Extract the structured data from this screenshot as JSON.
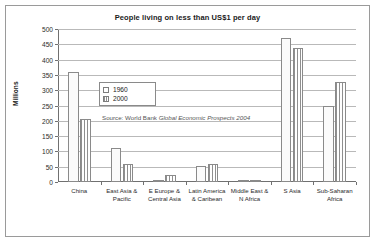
{
  "chart_data": {
    "type": "bar",
    "title": "People living on less than US$1 per day",
    "xlabel": "",
    "ylabel": "Millions",
    "ylim": [
      0,
      500
    ],
    "yticks": [
      0,
      50,
      100,
      150,
      200,
      250,
      300,
      350,
      400,
      450,
      500
    ],
    "grid": true,
    "legend_position": "inside-upper-left",
    "categories": [
      "China",
      "East Asia &\nPacific",
      "E Europe &\nCentral Asia",
      "Latin America\n& Caribean",
      "Middle East &\nN Africa",
      "S Asia",
      "Sub-Saharan\nAfrica"
    ],
    "series": [
      {
        "name": "1960",
        "values": [
          360,
          110,
          7,
          52,
          5,
          470,
          247
        ]
      },
      {
        "name": "2000",
        "values": [
          205,
          58,
          22,
          58,
          8,
          437,
          328
        ]
      }
    ],
    "annotations": {
      "source_prefix": "Source:  World Bank ",
      "source_italic": "Global Economic Prospects 2004"
    }
  },
  "legend": {
    "items": [
      {
        "label": "1960",
        "swatch": "white-square-icon"
      },
      {
        "label": "2000",
        "swatch": "hatched-square-icon"
      }
    ]
  },
  "colors": {
    "series_1960": "#fbfbfb",
    "series_2000_hatch": "#8f8f8f",
    "gridline": "#b9b9b9",
    "axis": "#707070",
    "frame": "#9a9a9a",
    "text": "#1a1a1a"
  }
}
